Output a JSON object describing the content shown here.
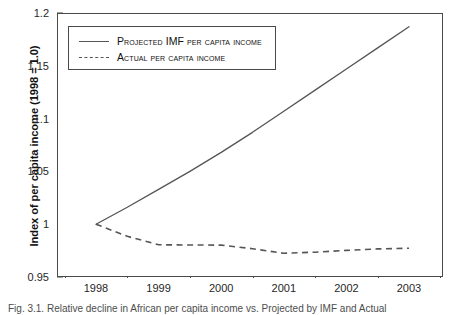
{
  "chart_data": {
    "type": "line",
    "title": "",
    "xlabel": "",
    "ylabel": "Index of per capita income (1998 = 1.0)",
    "xlim": [
      1998,
      2003.2
    ],
    "ylim": [
      0.95,
      1.2
    ],
    "grid": false,
    "legend_position": "upper-left",
    "x_tick_labels": [
      "1998",
      "1999",
      "2000",
      "2001",
      "2002",
      "2003"
    ],
    "y_tick_labels": [
      "0.95",
      "1",
      "1.05",
      "1.1",
      "1.15",
      "1.2"
    ],
    "y_tick_values": [
      0.95,
      1.0,
      1.05,
      1.1,
      1.15,
      1.2
    ],
    "x": [
      1998,
      1998.5,
      1999,
      1999.5,
      2000,
      2000.5,
      2001,
      2001.5,
      2002,
      2002.5,
      2003
    ],
    "series": [
      {
        "name": "Projected IMF per capita income",
        "style": "solid",
        "color": "#555555",
        "values": [
          1.0,
          1.016,
          1.033,
          1.05,
          1.068,
          1.087,
          1.107,
          1.127,
          1.147,
          1.167,
          1.187
        ]
      },
      {
        "name": "Actual per capita income",
        "style": "dashed",
        "color": "#555555",
        "values": [
          1.0,
          0.9885,
          0.9805,
          0.9803,
          0.9802,
          0.9768,
          0.9725,
          0.9735,
          0.9752,
          0.9766,
          0.9772
        ]
      }
    ]
  },
  "y_axis": {
    "title": "Index of per capita income (1998 = 1.0)"
  },
  "legend": {
    "entries": [
      {
        "label": "Projected IMF per capita income",
        "style": "solid"
      },
      {
        "label": "Actual per capita income",
        "style": "dashed"
      }
    ]
  },
  "caption": {
    "text": "Fig. 3.1. Relative decline in African per capita income vs. Projected by IMF and Actual"
  },
  "colors": {
    "line": "#555555",
    "axis": "#4a4a4a",
    "text": "#111111",
    "background": "#ffffff"
  }
}
